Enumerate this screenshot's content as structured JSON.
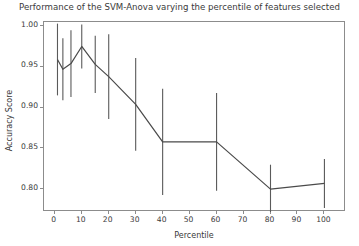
{
  "chart_data": {
    "type": "line",
    "title": "Performance of the SVM-Anova varying the percentile of features selected",
    "xlabel": "Percentile",
    "ylabel": "Accuracy Score",
    "xlim": [
      -4,
      108
    ],
    "ylim": [
      0.772,
      1.005
    ],
    "grid": false,
    "legend": null,
    "xticks": [
      0,
      10,
      20,
      30,
      40,
      50,
      60,
      70,
      80,
      90,
      100
    ],
    "xtick_labels": [
      "0",
      "10",
      "20",
      "30",
      "40",
      "50",
      "60",
      "70",
      "80",
      "90",
      "100"
    ],
    "yticks": [
      0.8,
      0.85,
      0.9,
      0.95,
      1.0
    ],
    "ytick_labels": [
      "0.80",
      "0.85",
      "0.90",
      "0.95",
      "1.00"
    ],
    "series": [
      {
        "name": "SVM-Anova accuracy",
        "marker": "none",
        "line_color": "#4a4a4a",
        "errorbar_color": "#5a5a5a",
        "x": [
          1,
          3,
          6,
          10,
          15,
          20,
          30,
          40,
          60,
          80,
          100
        ],
        "values": [
          0.959,
          0.947,
          0.954,
          0.975,
          0.953,
          0.938,
          0.904,
          0.858,
          0.858,
          0.8,
          0.807
        ],
        "yerr": [
          0.044,
          0.038,
          0.041,
          0.027,
          0.035,
          0.052,
          0.057,
          0.065,
          0.06,
          0.03,
          0.03
        ],
        "ylow": [
          0.915,
          0.909,
          0.913,
          0.948,
          0.918,
          0.886,
          0.847,
          0.793,
          0.798,
          0.77,
          0.777
        ],
        "yhigh": [
          1.003,
          0.985,
          0.995,
          1.002,
          0.988,
          0.99,
          0.961,
          0.923,
          0.918,
          0.83,
          0.837
        ]
      }
    ]
  }
}
